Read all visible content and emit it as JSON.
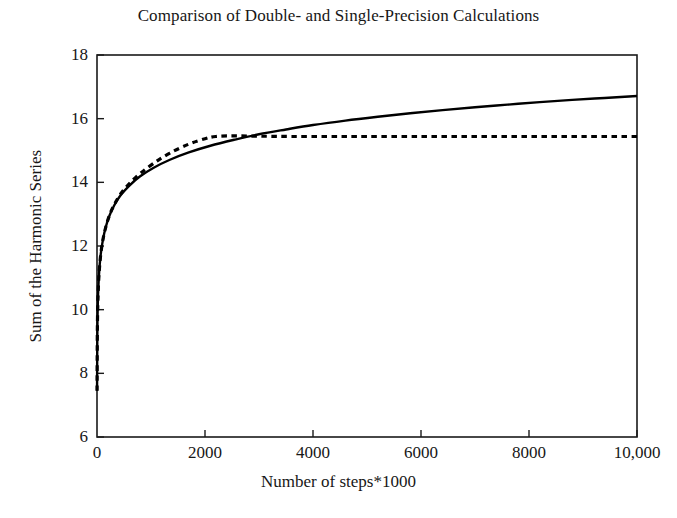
{
  "chart_data": {
    "type": "line",
    "title": "Comparison of Double- and Single-Precision Calculations",
    "xlabel": "Number of steps*1000",
    "ylabel": "Sum of the Harmonic Series",
    "xlim": [
      0,
      10000
    ],
    "ylim": [
      6,
      18
    ],
    "xticks": [
      0,
      2000,
      4000,
      6000,
      8000,
      10000
    ],
    "xtick_labels": [
      "0",
      "2000",
      "4000",
      "6000",
      "8000",
      "10,000"
    ],
    "yticks": [
      6,
      8,
      10,
      12,
      14,
      16,
      18
    ],
    "ytick_labels": [
      "6",
      "8",
      "10",
      "12",
      "14",
      "16",
      "18"
    ],
    "grid": false,
    "legend": "none",
    "series": [
      {
        "name": "double-precision",
        "style": "solid",
        "color": "#000000",
        "x": [
          1,
          5,
          10,
          20,
          40,
          70,
          110,
          160,
          230,
          320,
          440,
          600,
          800,
          1050,
          1350,
          1700,
          2100,
          2550,
          3000,
          3500,
          4000,
          4600,
          5200,
          5800,
          6400,
          7000,
          7600,
          8200,
          8800,
          9400,
          10000
        ],
        "y": [
          7.45,
          9.02,
          9.79,
          10.49,
          11.18,
          11.75,
          12.2,
          12.58,
          12.95,
          13.28,
          13.6,
          13.9,
          14.19,
          14.46,
          14.71,
          14.94,
          15.15,
          15.34,
          15.51,
          15.66,
          15.8,
          15.94,
          16.06,
          16.17,
          16.27,
          16.36,
          16.44,
          16.52,
          16.59,
          16.65,
          16.71
        ]
      },
      {
        "name": "single-precision",
        "style": "dashed",
        "color": "#000000",
        "x": [
          1,
          5,
          10,
          20,
          40,
          70,
          110,
          160,
          230,
          320,
          440,
          600,
          800,
          1050,
          1350,
          1700,
          2000,
          2200,
          2500,
          3000,
          3600,
          4300,
          5000,
          6000,
          7000,
          8000,
          9000,
          10000
        ],
        "y": [
          7.45,
          9.02,
          9.79,
          10.49,
          11.18,
          11.75,
          12.2,
          12.58,
          12.96,
          13.3,
          13.64,
          13.96,
          14.28,
          14.6,
          14.92,
          15.2,
          15.37,
          15.44,
          15.46,
          15.45,
          15.44,
          15.44,
          15.44,
          15.44,
          15.44,
          15.44,
          15.44,
          15.44
        ]
      }
    ],
    "annotations": {
      "plateau_value": 15.44,
      "crossover_x": 2980,
      "final_double": 16.71
    }
  },
  "axes_geometry": {
    "left": 97,
    "right": 637,
    "top": 55,
    "bottom": 437
  }
}
